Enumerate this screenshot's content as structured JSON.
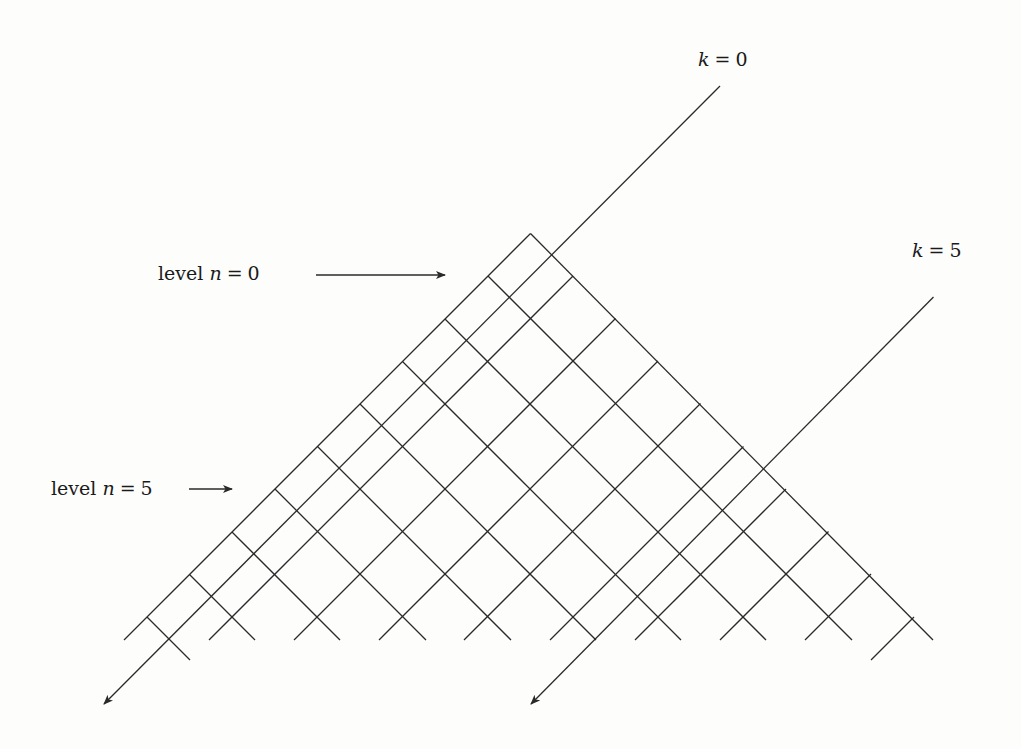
{
  "figure": {
    "labels": {
      "k0": {
        "var": "k",
        "op": "=",
        "value": "0"
      },
      "k5": {
        "var": "k",
        "op": "=",
        "value": "5"
      },
      "level0": {
        "word": "level",
        "var": "n",
        "op": "=",
        "value": "0"
      },
      "level5": {
        "word": "level",
        "var": "n",
        "op": "=",
        "value": "5"
      }
    },
    "colors": {
      "line": "#2a2a2a",
      "background": "#fdfdfc"
    },
    "geometry": {
      "apex": [
        530.5,
        233.5
      ],
      "step": 85.2,
      "down_left_lines_count": 10,
      "down_right_lines_count": 10,
      "highlighted_diagonals": [
        "k = 0",
        "k = 5"
      ]
    }
  }
}
